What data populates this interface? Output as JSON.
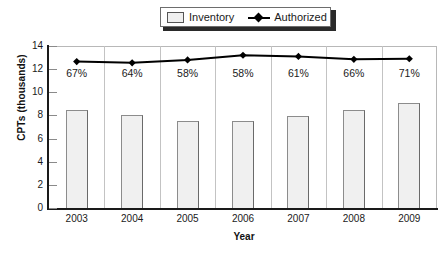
{
  "chart_data": {
    "type": "bar",
    "title": "",
    "xlabel": "Year",
    "ylabel": "CPTs (thousands)",
    "categories": [
      "2003",
      "2004",
      "2005",
      "2006",
      "2007",
      "2008",
      "2009"
    ],
    "ylim": [
      0,
      14
    ],
    "yticks": [
      0,
      2,
      4,
      6,
      8,
      10,
      12,
      14
    ],
    "ytick_labels": [
      "0",
      "2",
      "4",
      "6",
      "8",
      "10",
      "12",
      "14"
    ],
    "grid": false,
    "legend_position": "top-center",
    "series": [
      {
        "name": "Inventory",
        "type": "bar",
        "values": [
          8.5,
          8.05,
          7.55,
          7.55,
          7.95,
          8.45,
          9.05
        ],
        "color": "#f0f0f0",
        "edge_color": "#8c8c8c"
      },
      {
        "name": "Authorized",
        "type": "line",
        "values": [
          12.65,
          12.55,
          12.8,
          13.2,
          13.1,
          12.85,
          12.9
        ],
        "color": "#000000",
        "marker": "diamond"
      }
    ],
    "annotations": [
      "67%",
      "64%",
      "58%",
      "58%",
      "61%",
      "66%",
      "71%"
    ]
  },
  "legend": {
    "items": [
      {
        "label": "Inventory",
        "marker": "square-swatch"
      },
      {
        "label": "Authorized",
        "marker": "line-diamond"
      }
    ]
  },
  "axes": {
    "y_title": "CPTs (thousands)",
    "x_title": "Year"
  }
}
